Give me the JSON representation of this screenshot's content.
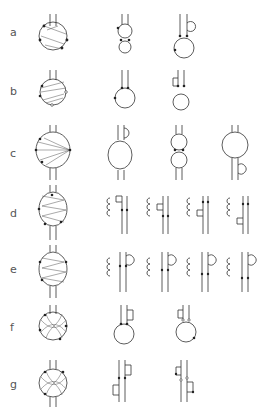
{
  "figure": {
    "rows": [
      {
        "label": "a",
        "y": 24,
        "variants": 2
      },
      {
        "label": "b",
        "y": 78,
        "variants": 2
      },
      {
        "label": "c",
        "y": 147,
        "variants": 3
      },
      {
        "label": "d",
        "y": 211,
        "variants": 4
      },
      {
        "label": "e",
        "y": 268,
        "variants": 4
      },
      {
        "label": "f",
        "y": 326,
        "variants": 2
      },
      {
        "label": "g",
        "y": 384,
        "variants": 2
      }
    ]
  }
}
